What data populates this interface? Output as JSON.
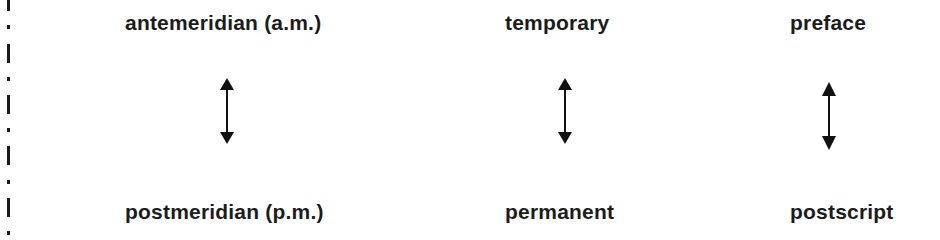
{
  "pairs": [
    {
      "top": "antemeridian (a.m.)",
      "bottom": "postmeridian (p.m.)",
      "relation": "double-headed-arrow"
    },
    {
      "top": "temporary",
      "bottom": "permanent",
      "relation": "double-headed-arrow"
    },
    {
      "top": "preface",
      "bottom": "postscript",
      "relation": "double-headed-arrow"
    }
  ],
  "colors": {
    "text": "#1c1c1c",
    "arrow": "#111111",
    "background": "#ffffff"
  }
}
